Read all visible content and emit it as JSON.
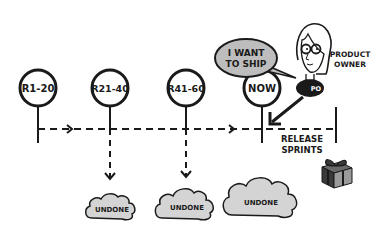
{
  "diagram": {
    "releases": [
      {
        "label": "R1-20",
        "cx": 38
      },
      {
        "label": "R21-40",
        "cx": 110
      },
      {
        "label": "R41-60",
        "cx": 186
      },
      {
        "label": "NOW",
        "cx": 262
      }
    ],
    "speech_bubble": "I WANT TO SHIP",
    "speech_lines": [
      "I WANT",
      "TO SHIP"
    ],
    "actor": {
      "role_lines": [
        "PRODUCT",
        "OWNER"
      ],
      "badge": "PO"
    },
    "timeline_label_lines": [
      "RELEASE",
      "SPRINTS"
    ],
    "clouds": [
      {
        "label": "UNDONE"
      },
      {
        "label": "UNDONE"
      },
      {
        "label": "UNDONE"
      }
    ],
    "colors": {
      "ink": "#1a1a1a",
      "cloud_fill": "#d4d4d4",
      "bubble_fill": "#bdbdbd",
      "gift_dark": "#3a3a3a",
      "gift_light": "#9a9a9a"
    }
  }
}
